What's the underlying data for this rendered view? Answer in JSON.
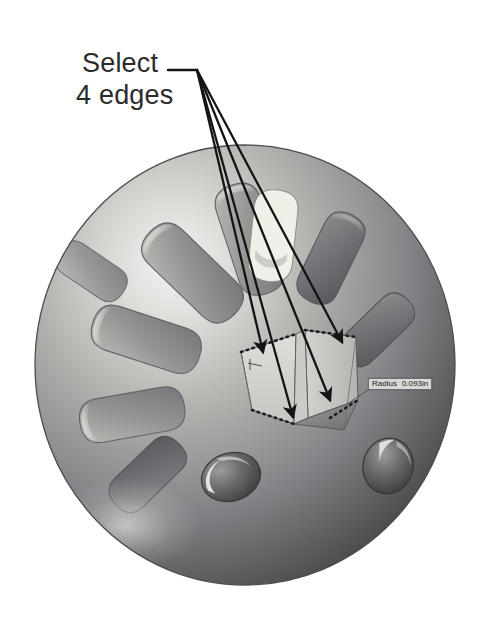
{
  "app": {
    "title": "Select 4 edges",
    "kind": "cad-3d-viewport",
    "background_color": "#ffffff"
  },
  "annotation": {
    "line1": "Select",
    "line2": "4 edges",
    "text_color": "#2b2b2b",
    "leader_color": "#1a1a1a",
    "arrow_count": 4,
    "leader_start": {
      "x": 168,
      "y": 70
    },
    "leader_elbow": {
      "x": 197,
      "y": 70
    },
    "arrow_tips": [
      {
        "x": 263,
        "y": 352
      },
      {
        "x": 293,
        "y": 417
      },
      {
        "x": 330,
        "y": 400
      },
      {
        "x": 342,
        "y": 342
      }
    ]
  },
  "tooltip": {
    "label": "Radius",
    "value": "0.093in",
    "background_color": "#d8d8d4",
    "border_color": "#6e6e6e",
    "text_color": "#1a1a1a",
    "position": {
      "x": 368,
      "y": 378
    },
    "connector_to": {
      "x": 347,
      "y": 404
    }
  },
  "model": {
    "name": "sphere-with-radial-pockets",
    "sphere": {
      "center": {
        "x": 245,
        "y": 365
      },
      "radius_x": 210,
      "radius_y": 220,
      "fill_light": "#f2f2f0",
      "fill_mid": "#9a9a98",
      "fill_dark": "#4a4a4a",
      "highlight_color": "#fbfbf9",
      "edge_color": "#5a5a58"
    },
    "pockets": {
      "shape": "teardrop-blade",
      "count": 9,
      "fill": "#8d8d8b",
      "rim_highlight": "#cfcfcd",
      "rim_shadow": "#5d5d5b"
    },
    "dimples": [
      {
        "name": "dimple-bottom-left",
        "cx": 231,
        "cy": 477,
        "rx": 30,
        "ry": 24,
        "rotation": -18
      },
      {
        "name": "dimple-bottom-right",
        "cx": 386,
        "cy": 466,
        "rx": 24,
        "ry": 27,
        "rotation": 12
      }
    ],
    "top_highlight_pocket": {
      "cx": 268,
      "cy": 193,
      "fill": "#f0efe9"
    }
  },
  "selection": {
    "edge_count": 4,
    "marker_style": "dotted",
    "marker_color": "#1e1e1e",
    "box": {
      "name": "rectangular-boss",
      "face_fill_front": "#d3d3d0",
      "face_fill_side": "#c2c2bf",
      "face_fill_top": "#dedeDB",
      "floor_fill": "#8a8a88",
      "outline_color": "#4a4a48"
    },
    "edges": [
      {
        "name": "edge-top-left",
        "from": {
          "x": 241,
          "y": 352
        },
        "to": {
          "x": 296,
          "y": 334
        }
      },
      {
        "name": "edge-top-right",
        "from": {
          "x": 305,
          "y": 330
        },
        "to": {
          "x": 356,
          "y": 337
        }
      },
      {
        "name": "edge-bottom-left",
        "from": {
          "x": 252,
          "y": 410
        },
        "to": {
          "x": 292,
          "y": 424
        }
      },
      {
        "name": "edge-bottom-right",
        "from": {
          "x": 330,
          "y": 418
        },
        "to": {
          "x": 358,
          "y": 400
        }
      }
    ]
  }
}
